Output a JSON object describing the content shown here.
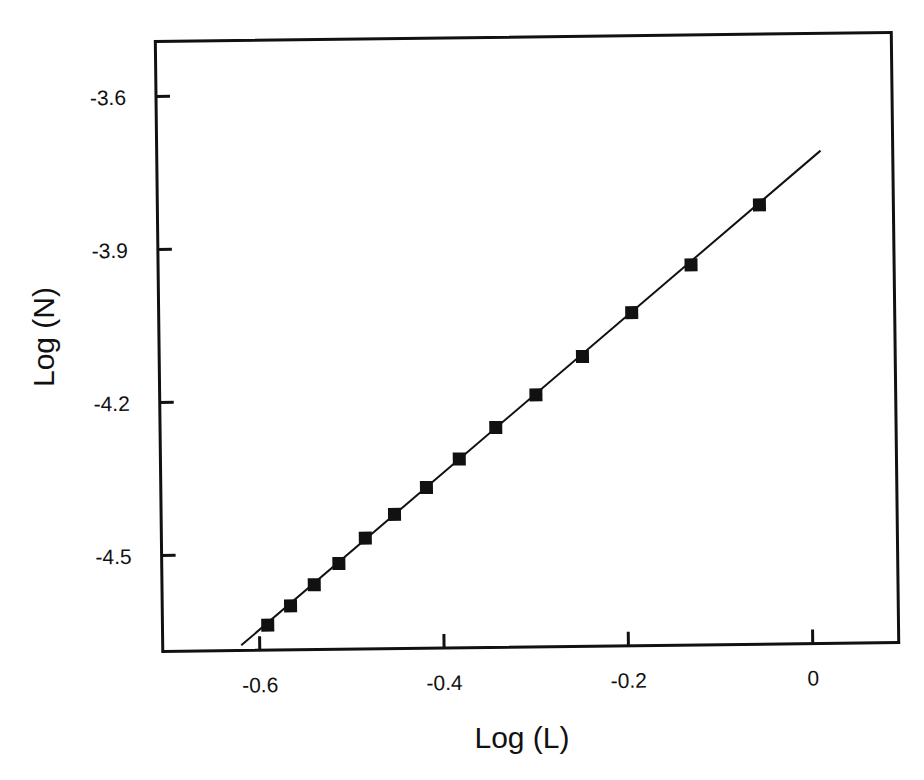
{
  "chart_data": {
    "type": "scatter",
    "title": "",
    "xlabel": "Log (L)",
    "ylabel": "Log (N)",
    "xlim": [
      -0.7,
      0.095
    ],
    "ylim": [
      -4.72,
      -3.51
    ],
    "grid": false,
    "legend": null,
    "x_ticks": [
      -0.6,
      -0.4,
      -0.2,
      0
    ],
    "x_tick_labels": [
      "-0.6",
      "-0.4",
      "-0.2",
      "0"
    ],
    "y_ticks": [
      -3.6,
      -3.9,
      -4.2,
      -4.5
    ],
    "y_tick_labels": [
      "-3.6",
      "-3.9",
      "-4.2",
      "-4.5"
    ],
    "series": [
      {
        "name": "data",
        "marker": "filled-square",
        "color": "#111111",
        "x": [
          -0.591,
          -0.566,
          -0.54,
          -0.513,
          -0.484,
          -0.452,
          -0.417,
          -0.381,
          -0.341,
          -0.297,
          -0.246,
          -0.192,
          -0.127,
          -0.052
        ],
        "y": [
          -4.639,
          -4.602,
          -4.561,
          -4.52,
          -4.471,
          -4.425,
          -4.373,
          -4.318,
          -4.257,
          -4.194,
          -4.12,
          -4.035,
          -3.943,
          -3.827
        ]
      },
      {
        "name": "linear fit",
        "type": "line",
        "color": "#111111",
        "x": [
          -0.62,
          0.015
        ],
        "y": [
          -4.678,
          -3.722
        ]
      }
    ]
  }
}
